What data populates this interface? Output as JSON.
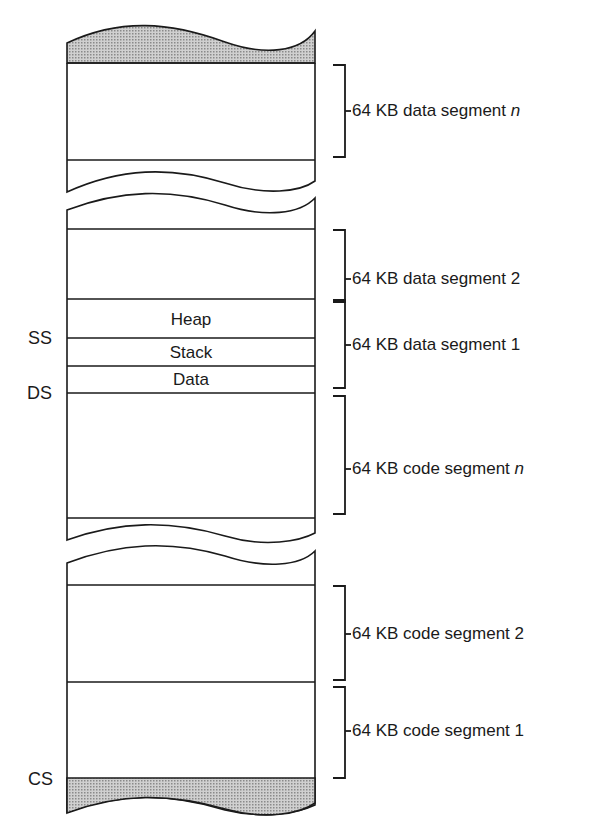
{
  "diagram": {
    "type": "memory-segment-layout",
    "segments": [
      {
        "label_prefix": "64 KB data segment ",
        "label_suffix": "n",
        "suffix_italic": true
      },
      {
        "label_prefix": "64 KB data segment ",
        "label_suffix": "2",
        "suffix_italic": false
      },
      {
        "label_prefix": "64 KB data segment ",
        "label_suffix": "1",
        "suffix_italic": false
      },
      {
        "label_prefix": "64 KB code segment ",
        "label_suffix": "n",
        "suffix_italic": true
      },
      {
        "label_prefix": "64 KB code segment ",
        "label_suffix": "2",
        "suffix_italic": false
      },
      {
        "label_prefix": "64 KB code segment ",
        "label_suffix": "1",
        "suffix_italic": false
      }
    ],
    "inner_regions": [
      "Heap",
      "Stack",
      "Data"
    ],
    "registers": {
      "ss": "SS",
      "ds": "DS",
      "cs": "CS"
    },
    "colors": {
      "stroke": "#1a1a1a",
      "shade": "#b8b8b8",
      "background": "#ffffff"
    }
  }
}
